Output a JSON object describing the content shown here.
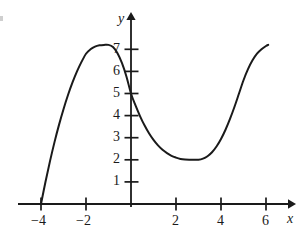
{
  "figure": {
    "background_color": "#ffffff",
    "ink_color": "#1a1a1a",
    "axis_label_x": "x",
    "axis_label_y": "y"
  },
  "chart_data": {
    "type": "line",
    "title": "",
    "subtitle": "",
    "xlabel": "x",
    "ylabel": "y",
    "grid": false,
    "legend": "none",
    "xlim": [
      -4.8,
      6.9
    ],
    "ylim": [
      -0.6,
      8.1
    ],
    "xticks": [
      -4,
      -2,
      2,
      4,
      6
    ],
    "xtick_labels": [
      "−4",
      "−2",
      "2",
      "4",
      "6"
    ],
    "yticks": [
      1,
      2,
      3,
      4,
      5,
      6,
      7
    ],
    "ytick_labels": [
      "1",
      "2",
      "3",
      "4",
      "5",
      "6",
      "7"
    ],
    "annotations": [],
    "series": [
      {
        "name": "curve",
        "color": "#1a1a1a",
        "line_width": 2,
        "features": {
          "left_endpoint": [
            -4,
            0
          ],
          "local_maximum": [
            -1,
            7.2
          ],
          "y_intercept": [
            0,
            5
          ],
          "local_minimum": [
            3,
            2
          ],
          "right_endpoint": [
            6.1,
            7.2
          ]
        },
        "x": [
          -4,
          -3.8,
          -3.6,
          -3.4,
          -3.2,
          -3,
          -2.8,
          -2.6,
          -2.4,
          -2.2,
          -2,
          -1.8,
          -1.6,
          -1.4,
          -1.2,
          -1,
          -0.8,
          -0.6,
          -0.4,
          -0.2,
          0,
          0.2,
          0.4,
          0.6,
          0.8,
          1,
          1.2,
          1.4,
          1.6,
          1.8,
          2,
          2.2,
          2.4,
          2.6,
          2.8,
          3,
          3.2,
          3.4,
          3.6,
          3.8,
          4,
          4.2,
          4.4,
          4.6,
          4.8,
          5,
          5.2,
          5.4,
          5.6,
          5.8,
          6,
          6.1
        ],
        "y": [
          0,
          1.01,
          1.94,
          2.8,
          3.58,
          4.29,
          4.93,
          5.5,
          6.0,
          6.43,
          6.8,
          7.0,
          7.12,
          7.18,
          7.2,
          7.2,
          7.1,
          6.82,
          6.37,
          5.76,
          5.0,
          4.46,
          3.98,
          3.56,
          3.2,
          2.9,
          2.65,
          2.45,
          2.3,
          2.18,
          2.1,
          2.04,
          2.01,
          2.0,
          2.0,
          2.0,
          2.05,
          2.16,
          2.34,
          2.6,
          2.94,
          3.36,
          3.85,
          4.4,
          5.0,
          5.6,
          6.1,
          6.5,
          6.8,
          7.0,
          7.15,
          7.2
        ]
      }
    ]
  },
  "geometry": {
    "origin_px": [
      131,
      204
    ],
    "x_unit_px": 22.5,
    "y_unit_px": 22.1
  }
}
